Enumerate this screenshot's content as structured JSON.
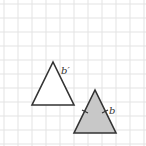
{
  "figure": {
    "grid": {
      "origin": 4,
      "spacing": 14,
      "count": 11,
      "color": "#e3e3e3"
    },
    "image_triangle": {
      "points": "53,62 32,105 74,105",
      "fill": "#ffffff",
      "stroke": "#333333",
      "label": "b′",
      "label_x": 61,
      "label_y": 74
    },
    "original_triangle": {
      "points": "95,90 74,133 116,133",
      "fill": "#c8c8c8",
      "stroke": "#333333",
      "label": "b",
      "label_x": 109,
      "label_y": 114
    }
  }
}
